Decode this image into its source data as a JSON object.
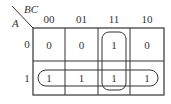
{
  "kmap": {
    "row_var": "A",
    "col_var": "BC",
    "col_labels": [
      "00",
      "01",
      "11",
      "10"
    ],
    "row_labels": [
      "0",
      "1"
    ],
    "cells": [
      [
        "0",
        "0",
        "1",
        "0"
      ],
      [
        "1",
        "1",
        "1",
        "1"
      ]
    ],
    "groups": [
      {
        "name": "row-A1",
        "cells": "A=1, all columns"
      },
      {
        "name": "column-BC11",
        "cells": "BC=11, both rows"
      }
    ]
  }
}
